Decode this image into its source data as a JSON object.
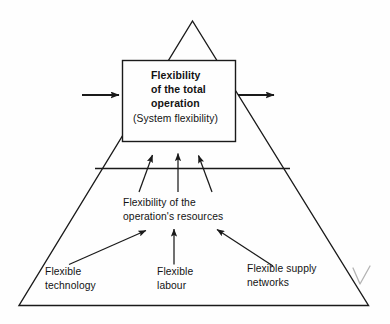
{
  "diagram": {
    "type": "pyramid-hierarchy",
    "title_box": {
      "title": "Flexibility\nof the total\noperation",
      "subtitle": "(System flexibility)"
    },
    "middle_layer": {
      "label": "Flexibility of the\noperation's resources"
    },
    "base_layer": {
      "labels": [
        "Flexible\ntechnology",
        "Flexible\nlabour",
        "Flexible supply\nnetworks"
      ]
    },
    "io_arrows": {
      "input_label": "",
      "output_label": ""
    },
    "colors": {
      "stroke": "#1a1a1a",
      "text": "#131313",
      "background": "#fefefe",
      "annotation": "#9a9a9a"
    },
    "annotation": {
      "mark": "handwritten-check-mark"
    }
  }
}
